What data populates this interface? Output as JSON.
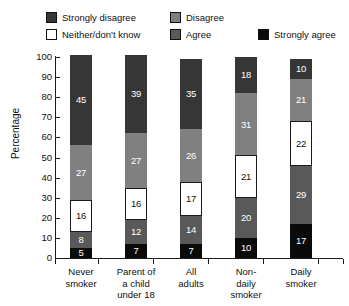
{
  "chart_data": {
    "type": "bar",
    "subtype": "stacked-100-percent",
    "title": "",
    "xlabel": "",
    "ylabel": "Percentage",
    "ylim": [
      0,
      100
    ],
    "yticks": [
      0,
      10,
      20,
      30,
      40,
      50,
      60,
      70,
      80,
      90,
      100
    ],
    "grid": false,
    "legend_position": "top",
    "stack_order": "bottom-to-top",
    "categories": [
      "Never smoker",
      "Parent of a child under 18",
      "All adults",
      "Non-daily smoker",
      "Daily smoker"
    ],
    "category_lines": [
      [
        "Never",
        "smoker"
      ],
      [
        "Parent of",
        "a child",
        "under 18"
      ],
      [
        "All",
        "adults"
      ],
      [
        "Non-",
        "daily",
        "smoker"
      ],
      [
        "Daily",
        "smoker"
      ]
    ],
    "series": [
      {
        "name": "Strongly agree",
        "color": "#0a0a0a",
        "label_color": "#ffffff",
        "values": [
          5,
          7,
          7,
          10,
          17
        ]
      },
      {
        "name": "Agree",
        "color": "#595959",
        "label_color": "#ffffff",
        "values": [
          8,
          12,
          14,
          20,
          29
        ]
      },
      {
        "name": "Neither/don't know",
        "color": "#ffffff",
        "label_color": "#101010",
        "values": [
          16,
          16,
          17,
          21,
          22
        ]
      },
      {
        "name": "Disagree",
        "color": "#808080",
        "label_color": "#ffffff",
        "values": [
          27,
          27,
          26,
          31,
          21
        ]
      },
      {
        "name": "Strongly disagree",
        "color": "#363636",
        "label_color": "#ffffff",
        "values": [
          45,
          39,
          35,
          18,
          10
        ]
      }
    ]
  },
  "legend": {
    "items": [
      {
        "id": "lg-sd",
        "label": "Strongly disagree",
        "color": "#363636"
      },
      {
        "id": "lg-d",
        "label": "Disagree",
        "color": "#808080"
      },
      {
        "id": "lg-n",
        "label": "Neither/don't know",
        "color": "#ffffff"
      },
      {
        "id": "lg-a",
        "label": "Agree",
        "color": "#595959"
      },
      {
        "id": "lg-sa",
        "label": "Strongly agree",
        "color": "#0a0a0a"
      }
    ]
  },
  "caption": ""
}
